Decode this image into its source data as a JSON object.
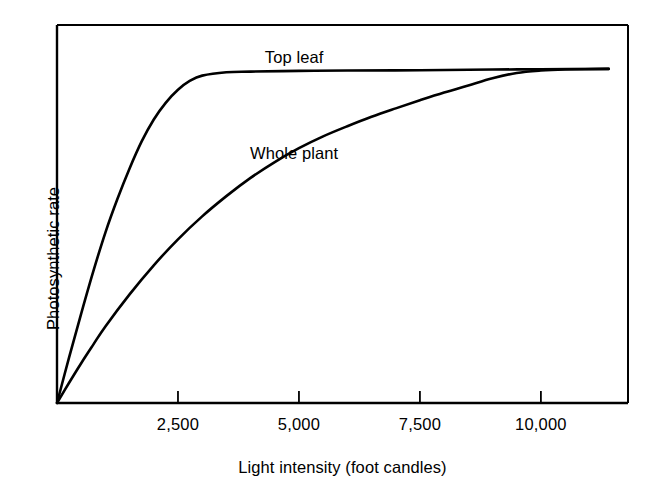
{
  "chart_data": {
    "type": "line",
    "title": "",
    "xlabel": "Light intensity (foot candles)",
    "ylabel": "Photosynthetic rate",
    "xlim": [
      0,
      11800
    ],
    "ylim": [
      0,
      1.12
    ],
    "grid": false,
    "legend_position": "inline-annotation",
    "xticks": [
      2500,
      5000,
      7500,
      10000
    ],
    "xtick_labels": [
      "2,500",
      "5,000",
      "7,500",
      "10,000"
    ],
    "yticks": [],
    "ytick_labels": [],
    "axis_color": "#000000",
    "line_color": "#000000",
    "background_color": "#ffffff",
    "series": [
      {
        "name": "Top leaf",
        "label_x": 4900,
        "label_y": 1.02,
        "points": [
          [
            0,
            0.0
          ],
          [
            250,
            0.135
          ],
          [
            500,
            0.265
          ],
          [
            750,
            0.39
          ],
          [
            1000,
            0.505
          ],
          [
            1250,
            0.605
          ],
          [
            1500,
            0.695
          ],
          [
            1750,
            0.775
          ],
          [
            2000,
            0.84
          ],
          [
            2250,
            0.89
          ],
          [
            2500,
            0.928
          ],
          [
            2750,
            0.955
          ],
          [
            3000,
            0.97
          ],
          [
            3500,
            0.98
          ],
          [
            4000,
            0.982
          ],
          [
            5000,
            0.984
          ],
          [
            6000,
            0.985
          ],
          [
            7500,
            0.986
          ],
          [
            9000,
            0.988
          ],
          [
            10000,
            0.989
          ],
          [
            11400,
            0.99
          ]
        ]
      },
      {
        "name": "Whole plant",
        "label_x": 4900,
        "label_y": 0.735,
        "points": [
          [
            0,
            0.0
          ],
          [
            250,
            0.06
          ],
          [
            500,
            0.118
          ],
          [
            750,
            0.173
          ],
          [
            1000,
            0.227
          ],
          [
            1500,
            0.322
          ],
          [
            2000,
            0.408
          ],
          [
            2500,
            0.485
          ],
          [
            3000,
            0.553
          ],
          [
            3500,
            0.613
          ],
          [
            4000,
            0.667
          ],
          [
            4500,
            0.714
          ],
          [
            5000,
            0.755
          ],
          [
            5500,
            0.79
          ],
          [
            6000,
            0.82
          ],
          [
            6500,
            0.848
          ],
          [
            7000,
            0.873
          ],
          [
            7500,
            0.897
          ],
          [
            8000,
            0.92
          ],
          [
            8500,
            0.941
          ],
          [
            9000,
            0.962
          ],
          [
            9500,
            0.978
          ],
          [
            10000,
            0.985
          ],
          [
            10500,
            0.988
          ],
          [
            11400,
            0.99
          ]
        ]
      }
    ]
  }
}
